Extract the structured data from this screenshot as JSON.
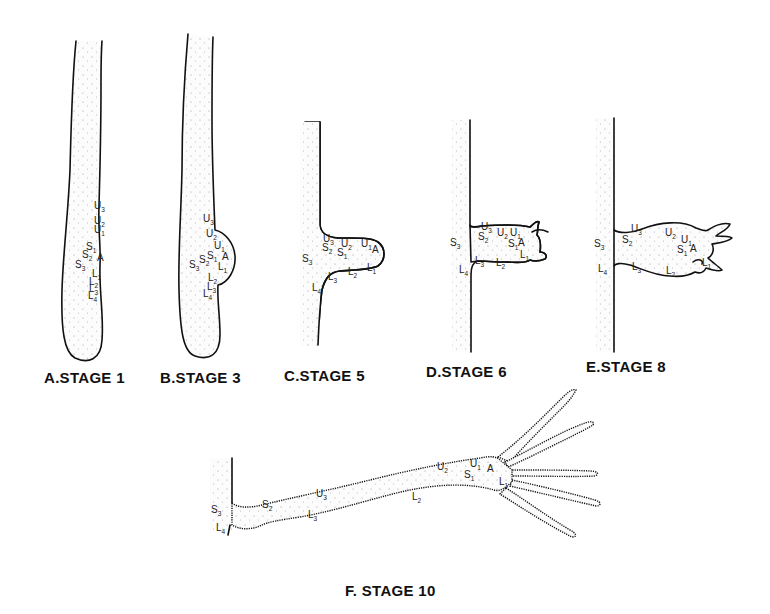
{
  "figure": {
    "panels": [
      {
        "id": "A",
        "caption": "A.STAGE 1",
        "labels": [
          {
            "t": "U",
            "s": "3",
            "x": 94,
            "y": 209
          },
          {
            "t": "U",
            "s": "2",
            "x": 94,
            "y": 224
          },
          {
            "t": "U",
            "s": "1",
            "x": 94,
            "y": 233
          },
          {
            "t": "S",
            "s": "1",
            "x": 86,
            "y": 250
          },
          {
            "t": "S",
            "s": "2",
            "x": 82,
            "y": 258
          },
          {
            "t": "A",
            "s": "",
            "x": 97,
            "y": 261
          },
          {
            "t": "S",
            "s": "3",
            "x": 75,
            "y": 268
          },
          {
            "t": "L",
            "s": "1",
            "x": 92,
            "y": 277
          },
          {
            "t": "L",
            "s": "2",
            "x": 89,
            "y": 285
          },
          {
            "t": "L",
            "s": "3",
            "x": 89,
            "y": 292
          },
          {
            "t": "L",
            "s": "4",
            "x": 88,
            "y": 299
          }
        ]
      },
      {
        "id": "B",
        "caption": "B.STAGE 3",
        "labels": [
          {
            "t": "U",
            "s": "3",
            "x": 203,
            "y": 222
          },
          {
            "t": "U",
            "s": "2",
            "x": 206,
            "y": 237
          },
          {
            "t": "U",
            "s": "1",
            "x": 214,
            "y": 249
          },
          {
            "t": "A",
            "s": "",
            "x": 222,
            "y": 260
          },
          {
            "t": "S",
            "s": "1",
            "x": 207,
            "y": 259
          },
          {
            "t": "S",
            "s": "2",
            "x": 199,
            "y": 263
          },
          {
            "t": "S",
            "s": "3",
            "x": 189,
            "y": 268
          },
          {
            "t": "L",
            "s": "1",
            "x": 218,
            "y": 270
          },
          {
            "t": "L",
            "s": "2",
            "x": 208,
            "y": 281
          },
          {
            "t": "L",
            "s": "3",
            "x": 207,
            "y": 290
          },
          {
            "t": "L",
            "s": "4",
            "x": 203,
            "y": 297
          }
        ]
      },
      {
        "id": "C",
        "caption": "C.STAGE 5",
        "labels": [
          {
            "t": "U",
            "s": "3",
            "x": 323,
            "y": 242
          },
          {
            "t": "U",
            "s": "2",
            "x": 341,
            "y": 247
          },
          {
            "t": "U",
            "s": "1",
            "x": 361,
            "y": 247
          },
          {
            "t": "A",
            "s": "",
            "x": 372,
            "y": 253
          },
          {
            "t": "S",
            "s": "2",
            "x": 322,
            "y": 251
          },
          {
            "t": "S",
            "s": "1",
            "x": 337,
            "y": 256
          },
          {
            "t": "S",
            "s": "3",
            "x": 302,
            "y": 262
          },
          {
            "t": "L",
            "s": "1",
            "x": 367,
            "y": 271
          },
          {
            "t": "L",
            "s": "2",
            "x": 348,
            "y": 275
          },
          {
            "t": "L",
            "s": "3",
            "x": 328,
            "y": 280
          },
          {
            "t": "L",
            "s": "4",
            "x": 312,
            "y": 291
          }
        ]
      },
      {
        "id": "D",
        "caption": "D.STAGE 6",
        "labels": [
          {
            "t": "U",
            "s": "3",
            "x": 481,
            "y": 230
          },
          {
            "t": "S",
            "s": "2",
            "x": 478,
            "y": 240
          },
          {
            "t": "U",
            "s": "2",
            "x": 497,
            "y": 236
          },
          {
            "t": "U",
            "s": "1",
            "x": 510,
            "y": 236
          },
          {
            "t": "S",
            "s": "1",
            "x": 508,
            "y": 247
          },
          {
            "t": "A",
            "s": "",
            "x": 518,
            "y": 246
          },
          {
            "t": "S",
            "s": "3",
            "x": 450,
            "y": 246
          },
          {
            "t": "L",
            "s": "1",
            "x": 520,
            "y": 258
          },
          {
            "t": "L",
            "s": "3",
            "x": 475,
            "y": 264
          },
          {
            "t": "L",
            "s": "2",
            "x": 496,
            "y": 266
          },
          {
            "t": "L",
            "s": "4",
            "x": 459,
            "y": 273
          }
        ]
      },
      {
        "id": "E",
        "caption": "E.STAGE 8",
        "labels": [
          {
            "t": "U",
            "s": "3",
            "x": 631,
            "y": 232
          },
          {
            "t": "S",
            "s": "2",
            "x": 622,
            "y": 243
          },
          {
            "t": "U",
            "s": "2",
            "x": 665,
            "y": 236
          },
          {
            "t": "U",
            "s": "1",
            "x": 681,
            "y": 243
          },
          {
            "t": "S",
            "s": "1",
            "x": 677,
            "y": 253
          },
          {
            "t": "A",
            "s": "",
            "x": 690,
            "y": 252
          },
          {
            "t": "S",
            "s": "3",
            "x": 594,
            "y": 247
          },
          {
            "t": "L",
            "s": "1",
            "x": 702,
            "y": 266
          },
          {
            "t": "L",
            "s": "3",
            "x": 632,
            "y": 270
          },
          {
            "t": "L",
            "s": "2",
            "x": 666,
            "y": 274
          },
          {
            "t": "L",
            "s": "4",
            "x": 598,
            "y": 272
          }
        ]
      },
      {
        "id": "F",
        "caption": "F. STAGE 10",
        "labels": [
          {
            "t": "U",
            "s": "2",
            "x": 437,
            "y": 470
          },
          {
            "t": "U",
            "s": "1",
            "x": 470,
            "y": 467
          },
          {
            "t": "A",
            "s": "",
            "x": 487,
            "y": 472
          },
          {
            "t": "S",
            "s": "1",
            "x": 464,
            "y": 478
          },
          {
            "t": "L",
            "s": "1",
            "x": 499,
            "y": 485
          },
          {
            "t": "U",
            "s": "3",
            "x": 316,
            "y": 497
          },
          {
            "t": "L",
            "s": "2",
            "x": 412,
            "y": 500
          },
          {
            "t": "S",
            "s": "2",
            "x": 262,
            "y": 508
          },
          {
            "t": "S",
            "s": "3",
            "x": 211,
            "y": 513
          },
          {
            "t": "L",
            "s": "3",
            "x": 308,
            "y": 518
          },
          {
            "t": "L",
            "s": "4",
            "x": 216,
            "y": 531
          }
        ]
      }
    ]
  }
}
